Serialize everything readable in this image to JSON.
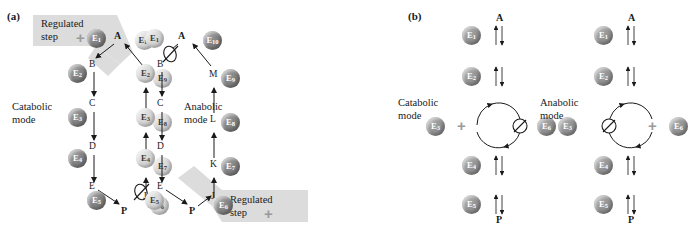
{
  "figure": {
    "panels": [
      {
        "letter": "(a)",
        "diagrams": [
          {
            "mode_label_line1": "Catabolic",
            "mode_label_line2": "mode",
            "regulated_banner": {
              "line1": "Regulated",
              "line2": "step",
              "symbol": "+"
            },
            "top_metabolite": "A",
            "bottom_metabolite": "P",
            "down_chain_metabolites": [
              "B",
              "C",
              "D",
              "E"
            ],
            "up_chain_metabolites": [
              "J",
              "K",
              "L",
              "M"
            ],
            "down_chain_enzymes": [
              "E1",
              "E2",
              "E3",
              "E4",
              "E5"
            ],
            "up_chain_enzymes": [
              "E6",
              "E7",
              "E8",
              "E9",
              "E10"
            ],
            "blocked_step_enzyme": "E6",
            "blocked_symbol": "null-slash"
          },
          {
            "mode_label_line1": "Anabolic",
            "mode_label_line2": "mode",
            "regulated_banner": {
              "line1": "Regulated",
              "line2": "step",
              "symbol": "+"
            },
            "top_metabolite": "A",
            "bottom_metabolite": "P",
            "down_chain_metabolites": [
              "B",
              "C",
              "D",
              "E"
            ],
            "up_chain_metabolites": [
              "J",
              "K",
              "L",
              "M"
            ],
            "down_chain_enzymes": [
              "E1",
              "E2",
              "E3",
              "E4",
              "E5"
            ],
            "up_chain_enzymes": [
              "E6",
              "E7",
              "E8",
              "E9",
              "E10"
            ],
            "blocked_step_enzyme": "E1",
            "blocked_symbol": "null-slash"
          }
        ]
      },
      {
        "letter": "(b)",
        "diagrams": [
          {
            "mode_label_line1": "Catabolic",
            "mode_label_line2": "mode",
            "top_metabolite": "A",
            "bottom_metabolite": "P",
            "chain_enzymes": [
              "E1",
              "E2",
              "E4",
              "E5"
            ],
            "cycle_left_enzyme": "E3",
            "cycle_right_enzyme": "E6",
            "cycle_left_symbol": "+",
            "cycle_right_symbol": "null-slash"
          },
          {
            "mode_label_line1": "Anabolic",
            "mode_label_line2": "mode",
            "top_metabolite": "A",
            "bottom_metabolite": "P",
            "chain_enzymes": [
              "E1",
              "E2",
              "E4",
              "E5"
            ],
            "cycle_left_enzyme": "E3",
            "cycle_right_enzyme": "E6",
            "cycle_left_symbol": "null-slash",
            "cycle_right_symbol": "+"
          }
        ]
      }
    ],
    "enzyme_labels": {
      "E1": "E",
      "E2": "E",
      "E3": "E",
      "E4": "E",
      "E5": "E",
      "E6": "E",
      "E7": "E",
      "E8": "E",
      "E9": "E",
      "E10": "E"
    },
    "colors": {
      "active_enzyme": "#7d7d7d",
      "inactive_enzyme": "#d2d2d2",
      "banner": "#dcdcdc",
      "plus_symbol": "#9a9a9a",
      "stroke": "#1a1a1a"
    }
  }
}
